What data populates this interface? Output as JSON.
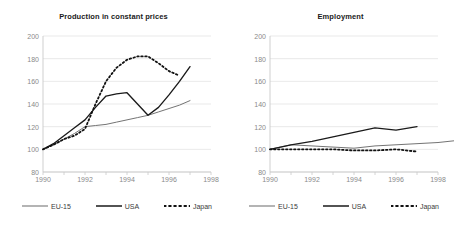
{
  "figure": {
    "background": "#ffffff",
    "series_colors": {
      "eu15": "#6b6b6b",
      "usa": "#1a1a1a",
      "japan": "#111111"
    },
    "grid_color": "#e3e3e3",
    "axis_color": "#c9c9c9",
    "label_color": "#8a8a8a"
  },
  "legend": {
    "items": [
      {
        "label": "EU-15",
        "style": "solid-thin",
        "color": "#6b6b6b"
      },
      {
        "label": "USA",
        "style": "solid-thick",
        "color": "#1a1a1a"
      },
      {
        "label": "Japan",
        "style": "dotted",
        "color": "#111111"
      }
    ]
  },
  "chart_data": [
    {
      "type": "line",
      "title": "Production in constant prices",
      "xlabel": "",
      "ylabel": "",
      "xlim": [
        1990,
        1998
      ],
      "ylim": [
        80,
        200
      ],
      "yticks": [
        80,
        100,
        120,
        140,
        160,
        180,
        200
      ],
      "xticks": [
        1990,
        1992,
        1994,
        1996,
        1998
      ],
      "grid": true,
      "legend_position": "bottom",
      "series": [
        {
          "name": "EU-15",
          "color": "#6b6b6b",
          "x": [
            1990,
            1990.5,
            1991,
            1991.5,
            1992,
            1992.5,
            1993,
            1993.5,
            1994,
            1994.5,
            1995,
            1995.5,
            1996,
            1996.5,
            1997
          ],
          "values": [
            100,
            104,
            109,
            114,
            120,
            121,
            122,
            124,
            126,
            128,
            130,
            133,
            136,
            139,
            143
          ]
        },
        {
          "name": "USA",
          "color": "#1a1a1a",
          "x": [
            1990,
            1990.5,
            1991,
            1991.5,
            1992,
            1992.5,
            1993,
            1993.5,
            1994,
            1994.5,
            1995,
            1995.5,
            1996,
            1996.5,
            1997
          ],
          "values": [
            100,
            105,
            112,
            119,
            126,
            137,
            147,
            149,
            150,
            140,
            130,
            137,
            148,
            160,
            173
          ]
        },
        {
          "name": "Japan",
          "color": "#111111",
          "x": [
            1990,
            1990.5,
            1991,
            1991.5,
            1992,
            1992.5,
            1993,
            1993.5,
            1994,
            1994.5,
            1995,
            1995.5,
            1996,
            1996.5
          ],
          "values": [
            100,
            104,
            109,
            112,
            118,
            140,
            160,
            172,
            179,
            182,
            182,
            176,
            169,
            165
          ]
        }
      ]
    },
    {
      "type": "line",
      "title": "Employment",
      "xlabel": "",
      "ylabel": "",
      "xlim": [
        1990,
        1998
      ],
      "ylim": [
        80,
        200
      ],
      "yticks": [
        80,
        100,
        120,
        140,
        160,
        180,
        200
      ],
      "xticks": [
        1990,
        1992,
        1994,
        1996,
        1998
      ],
      "grid": true,
      "legend_position": "bottom",
      "series": [
        {
          "name": "EU-15",
          "color": "#6b6b6b",
          "x": [
            1990,
            1991,
            1992,
            1993,
            1994,
            1995,
            1997,
            1998,
            1999
          ],
          "values": [
            100,
            104,
            103,
            102,
            101,
            103,
            105,
            106,
            108
          ]
        },
        {
          "name": "USA",
          "color": "#1a1a1a",
          "x": [
            1990,
            1991,
            1992,
            1993,
            1994,
            1995,
            1996,
            1997
          ],
          "values": [
            100,
            104,
            107,
            111,
            115,
            119,
            117,
            120
          ]
        },
        {
          "name": "Japan",
          "color": "#111111",
          "x": [
            1990,
            1991,
            1992,
            1993,
            1994,
            1995,
            1996,
            1997
          ],
          "values": [
            100,
            100,
            100,
            100,
            99,
            99,
            100,
            98
          ]
        }
      ]
    }
  ]
}
